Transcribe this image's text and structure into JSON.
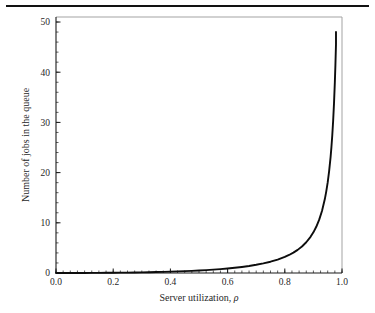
{
  "figure": {
    "name": "mm1-queue-length-plot",
    "background_color": "#ffffff",
    "top_rule_color": "#121212",
    "frame_color": "#9a9a9a",
    "axis_color": "#1a1a1a",
    "curve_color": "#0d0d0d"
  },
  "chart_data": {
    "type": "line",
    "title": "",
    "subtitle": "",
    "xlabel": "Server utilization, ρ",
    "ylabel": "Number of jobs in the queue",
    "xlabel_text": "Server utilization,",
    "xlabel_symbol": "ρ",
    "xlim": [
      0.0,
      1.0
    ],
    "ylim": [
      0,
      51
    ],
    "grid": false,
    "legend": null,
    "legend_position": "none",
    "x_ticks": [
      0.0,
      0.2,
      0.4,
      0.6,
      0.8,
      1.0
    ],
    "x_tick_labels": [
      "0.0",
      "0.2",
      "0.4",
      "0.6",
      "0.8",
      "1.0"
    ],
    "x_minor_tick_step": 0.025,
    "y_ticks": [
      0,
      10,
      20,
      30,
      40,
      50
    ],
    "y_tick_labels": [
      "0",
      "10",
      "20",
      "30",
      "40",
      "50"
    ],
    "y_minor_tick_step": 2,
    "formula": "Lq = ρ² / (1 − ρ)",
    "series": [
      {
        "name": "Number of jobs in the queue",
        "color": "#0d0d0d",
        "line_width": 1.9,
        "x": [
          0.0,
          0.025,
          0.05,
          0.075,
          0.1,
          0.125,
          0.15,
          0.175,
          0.2,
          0.225,
          0.25,
          0.275,
          0.3,
          0.325,
          0.35,
          0.375,
          0.4,
          0.425,
          0.45,
          0.475,
          0.5,
          0.525,
          0.55,
          0.575,
          0.6,
          0.625,
          0.65,
          0.675,
          0.7,
          0.725,
          0.75,
          0.775,
          0.8,
          0.815,
          0.83,
          0.845,
          0.86,
          0.875,
          0.89,
          0.9,
          0.91,
          0.92,
          0.93,
          0.94,
          0.945,
          0.95,
          0.955,
          0.96,
          0.963,
          0.966,
          0.969,
          0.972,
          0.975,
          0.977,
          0.979
        ],
        "y": [
          0.0,
          0.001,
          0.003,
          0.006,
          0.011,
          0.018,
          0.026,
          0.037,
          0.05,
          0.065,
          0.083,
          0.104,
          0.129,
          0.157,
          0.188,
          0.225,
          0.267,
          0.314,
          0.368,
          0.43,
          0.5,
          0.581,
          0.672,
          0.778,
          0.9,
          1.042,
          1.207,
          1.402,
          1.633,
          1.911,
          2.25,
          2.669,
          3.2,
          3.59,
          4.052,
          4.606,
          5.283,
          6.125,
          7.201,
          8.1,
          9.201,
          10.58,
          12.356,
          14.727,
          16.277,
          18.05,
          20.297,
          23.04,
          25.073,
          27.444,
          30.285,
          33.748,
          38.025,
          41.486,
          45.577
        ],
        "endpoint": {
          "x": 0.979,
          "y": 48.0
        }
      }
    ],
    "annotations": []
  }
}
